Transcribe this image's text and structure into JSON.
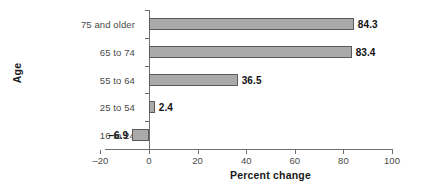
{
  "chart_data": {
    "type": "bar",
    "orientation": "horizontal",
    "title": "",
    "xlabel": "Percent change",
    "ylabel": "Age",
    "categories": [
      "16 to 24",
      "25 to 54",
      "55 to 64",
      "65 to 74",
      "75 and older"
    ],
    "values": [
      -6.9,
      2.4,
      36.5,
      83.4,
      84.3
    ],
    "value_labels": [
      "–6.9",
      "2.4",
      "36.5",
      "83.4",
      "84.3"
    ],
    "xlim": [
      -20,
      100
    ],
    "xticks": [
      -20,
      0,
      20,
      40,
      60,
      80,
      100
    ],
    "xtick_labels": [
      "–20",
      "0",
      "20",
      "40",
      "60",
      "80",
      "100"
    ],
    "grid": false,
    "legend": false,
    "bar_color": "#aaaaaa",
    "bar_border_color": "#5a5a5a",
    "axis_color": "#6e6e6e",
    "label_color": "#4a4a4a",
    "value_label_color": "#111111"
  }
}
